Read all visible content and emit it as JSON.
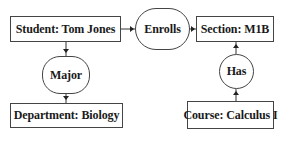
{
  "diagram": {
    "entities": [
      {
        "id": "student",
        "label": "Student: Tom Jones"
      },
      {
        "id": "section",
        "label": "Section: M1B"
      },
      {
        "id": "department",
        "label": "Department: Biology"
      },
      {
        "id": "course",
        "label": "Course: Calculus I"
      }
    ],
    "relationships": [
      {
        "id": "enrolls",
        "label": "Enrolls",
        "from": "student",
        "to": "section"
      },
      {
        "id": "major",
        "label": "Major",
        "from": "student",
        "to": "department"
      },
      {
        "id": "has",
        "label": "Has",
        "from": "course",
        "to": "section"
      }
    ]
  }
}
